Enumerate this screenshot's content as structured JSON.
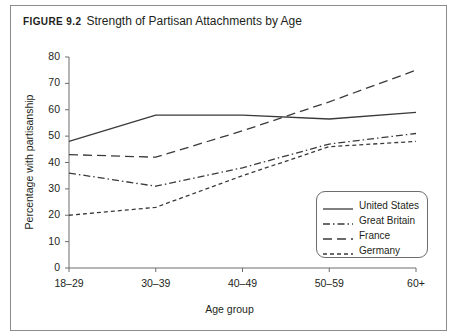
{
  "figure": {
    "number_label": "Figure 9.2",
    "title": "Strength of Partisan Attachments by Age"
  },
  "chart_data": {
    "type": "line",
    "title": "Strength of Partisan Attachments by Age",
    "xlabel": "Age group",
    "ylabel": "Percentage with partisanship",
    "categories": [
      "18–29",
      "30–39",
      "40–49",
      "50–59",
      "60+"
    ],
    "ylim": [
      0,
      80
    ],
    "yticks": [
      0,
      10,
      20,
      30,
      40,
      50,
      60,
      70,
      80
    ],
    "grid": false,
    "legend_position": "bottom-right",
    "series": [
      {
        "name": "United States",
        "style": "solid",
        "color": "#3a3a3a",
        "values": [
          48,
          58,
          58,
          56.5,
          59
        ]
      },
      {
        "name": "Great Britain",
        "style": "dash-dot",
        "color": "#3a3a3a",
        "values": [
          36,
          31,
          38,
          47,
          51
        ]
      },
      {
        "name": "France",
        "style": "long-dash",
        "color": "#3a3a3a",
        "values": [
          43,
          42,
          52,
          63,
          75
        ]
      },
      {
        "name": "Germany",
        "style": "short-dash",
        "color": "#3a3a3a",
        "values": [
          20,
          23,
          35,
          46,
          48
        ]
      }
    ]
  },
  "colors": {
    "frame": "#8c8c8c",
    "axis": "#6d6d6d",
    "text": "#231f20",
    "line": "#3a3a3a",
    "background": "#ffffff"
  }
}
